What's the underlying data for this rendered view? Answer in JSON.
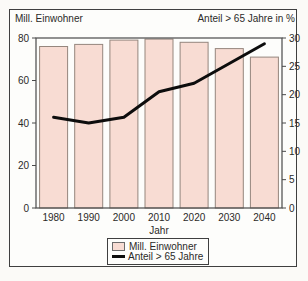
{
  "page": {
    "left_axis_title": "Mill. Einwohner",
    "right_axis_title": "Anteil > 65 Jahre in %",
    "xlabel": "Jahr"
  },
  "legend": {
    "items": [
      {
        "label": "Mill. Einwohner",
        "swatch": "bar-swatch"
      },
      {
        "label": "Anteil > 65 Jahre",
        "swatch": "line-swatch"
      }
    ]
  },
  "colors": {
    "bar_fill": "#f8dcd3",
    "bar_border": "#95867d",
    "line": "#0d0d0d",
    "frame": "#4a4a4a",
    "text": "#2b2a28",
    "plot_background": "#fdfdfb"
  },
  "chart_data": {
    "type": "bar",
    "title": "",
    "xlabel": "Jahr",
    "categories": [
      "1980",
      "1990",
      "2000",
      "2010",
      "2020",
      "2030",
      "2040"
    ],
    "series": [
      {
        "name": "Mill. Einwohner",
        "type": "bar",
        "axis": "left",
        "values": [
          76,
          77,
          79,
          79.5,
          78,
          75,
          71
        ]
      },
      {
        "name": "Anteil > 65 Jahre",
        "type": "line",
        "axis": "right",
        "values": [
          16,
          15,
          16,
          20.5,
          22,
          25.5,
          29
        ]
      }
    ],
    "left_axis": {
      "label": "Mill. Einwohner",
      "range": [
        0,
        80
      ],
      "ticks": [
        0,
        20,
        40,
        60,
        80
      ]
    },
    "right_axis": {
      "label": "Anteil > 65 Jahre in %",
      "range": [
        0,
        30
      ],
      "ticks": [
        0,
        5,
        10,
        15,
        20,
        25,
        30
      ]
    },
    "grid": false,
    "legend_position": "bottom"
  }
}
